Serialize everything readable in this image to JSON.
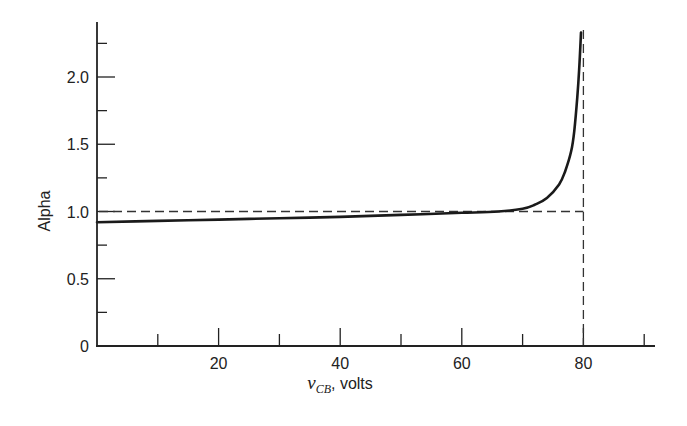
{
  "chart_data": {
    "type": "line",
    "title": "",
    "xlabel": "v_CB, volts",
    "xlabel_var": "v",
    "xlabel_sub": "CB",
    "xlabel_unit": ", volts",
    "ylabel": "Alpha",
    "xlim": [
      0,
      90
    ],
    "ylim": [
      0,
      2.35
    ],
    "x_ticks_major": [
      20,
      40,
      60,
      80
    ],
    "x_ticks_minor": [
      10,
      30,
      50,
      70,
      90
    ],
    "y_ticks_major": [
      0,
      0.5,
      1.0,
      1.5,
      2.0
    ],
    "y_tick_labels": [
      "0",
      "0.5",
      "1.0",
      "1.5",
      "2.0"
    ],
    "x_tick_labels": [
      "20",
      "40",
      "60",
      "80"
    ],
    "y_ticks_minor": [
      0.25,
      0.75,
      1.25,
      1.75,
      2.25
    ],
    "grid": false,
    "legend": null,
    "series": [
      {
        "name": "Alpha vs v_CB",
        "style": "solid",
        "x": [
          0,
          10,
          20,
          30,
          40,
          50,
          60,
          66,
          70,
          72,
          74,
          76,
          77,
          78,
          78.5,
          79,
          79.3,
          79.6
        ],
        "y": [
          0.92,
          0.93,
          0.94,
          0.95,
          0.96,
          0.975,
          0.99,
          1.0,
          1.02,
          1.05,
          1.1,
          1.2,
          1.3,
          1.45,
          1.6,
          1.85,
          2.05,
          2.33
        ]
      }
    ],
    "reference_lines": [
      {
        "name": "alpha = 1 reference",
        "style": "dashed",
        "type": "horizontal",
        "y": 1.0,
        "x_range": [
          0,
          80
        ]
      },
      {
        "name": "breakdown voltage",
        "style": "dashed",
        "type": "vertical",
        "x": 80,
        "y_range": [
          0,
          2.35
        ]
      }
    ]
  }
}
